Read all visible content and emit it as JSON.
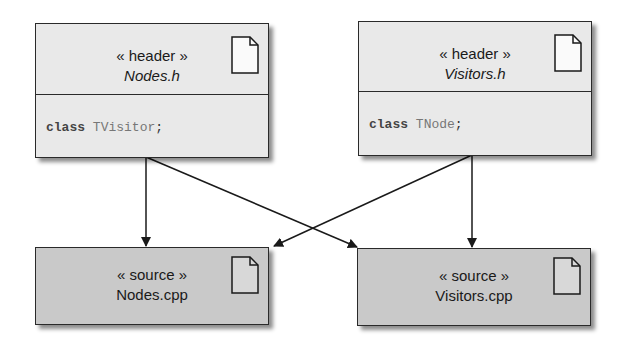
{
  "diagram": {
    "type": "UML file dependency diagram",
    "nodes": [
      {
        "id": "nodes_h",
        "stereotype": "« header »",
        "filename": "Nodes.h",
        "filename_italic": true,
        "code_keyword": "class",
        "code_type": "TVisitor",
        "code_end": ";",
        "icon": "document-icon"
      },
      {
        "id": "visitors_h",
        "stereotype": "« header »",
        "filename": "Visitors.h",
        "filename_italic": true,
        "code_keyword": "class",
        "code_type": "TNode",
        "code_end": ";",
        "icon": "document-icon"
      },
      {
        "id": "nodes_cpp",
        "stereotype": "« source »",
        "filename": "Nodes.cpp",
        "filename_italic": false,
        "icon": "document-icon"
      },
      {
        "id": "visitors_cpp",
        "stereotype": "« source »",
        "filename": "Visitors.cpp",
        "filename_italic": false,
        "icon": "document-icon"
      }
    ],
    "edges": [
      {
        "from": "nodes_h",
        "to": "nodes_cpp"
      },
      {
        "from": "nodes_h",
        "to": "visitors_cpp"
      },
      {
        "from": "visitors_h",
        "to": "visitors_cpp"
      },
      {
        "from": "visitors_h",
        "to": "nodes_cpp"
      }
    ],
    "colors": {
      "header_fill": "#e9e9e9",
      "source_fill": "#c9c9c9",
      "stroke": "#2a2a2a"
    }
  }
}
